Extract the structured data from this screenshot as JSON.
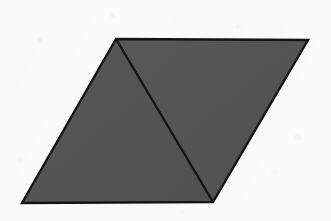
{
  "page": {
    "width": 331,
    "height": 221,
    "background_color": "#fbfbfb"
  },
  "figure": {
    "name": "parallelogram-with-diagonal",
    "fill_color": "#555555",
    "stroke_color": "#141414",
    "stroke_width": 2.4,
    "vertices": {
      "top_left": {
        "x": 116,
        "y": 39
      },
      "top_right": {
        "x": 308,
        "y": 40
      },
      "bottom_right": {
        "x": 213,
        "y": 202
      },
      "bottom_left": {
        "x": 22,
        "y": 203
      }
    },
    "outline_points": "116,39 308,40 213,202 22,203",
    "diagonal": {
      "name": "interior-diagonal",
      "from": {
        "x": 116,
        "y": 39
      },
      "to": {
        "x": 213,
        "y": 202
      }
    },
    "regions": [
      {
        "name": "left-triangle",
        "points": "116,39 213,202 22,203",
        "fill_color": "#565656"
      },
      {
        "name": "right-triangle",
        "points": "116,39 308,40 213,202",
        "fill_color": "#545454"
      }
    ]
  }
}
